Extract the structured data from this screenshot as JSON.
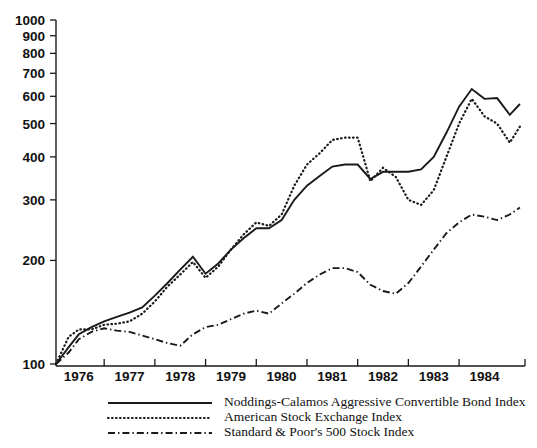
{
  "chart_data": {
    "type": "line",
    "title": "",
    "xlabel": "",
    "ylabel": "",
    "scale": "log",
    "ylim": [
      100,
      1000
    ],
    "xlim": [
      1975.5,
      1984.8
    ],
    "grid": false,
    "legend_position": "bottom-center",
    "ytick_labels": [
      "1000",
      "900",
      "800",
      "700",
      "600",
      "500",
      "400",
      "300",
      "200",
      "100"
    ],
    "ytick_values": [
      1000,
      900,
      800,
      700,
      600,
      500,
      400,
      300,
      200,
      100
    ],
    "xtick_labels": [
      "1976",
      "1977",
      "1978",
      "1979",
      "1980",
      "1981",
      "1982",
      "1983",
      "1984"
    ],
    "xtick_values": [
      1976,
      1977,
      1978,
      1979,
      1980,
      1981,
      1982,
      1983,
      1984
    ],
    "series": [
      {
        "name": "Noddings-Calamos Aggressive Convertible Bond Index",
        "style": "solid",
        "x": [
          1975.55,
          1975.8,
          1976.0,
          1976.25,
          1976.5,
          1976.75,
          1977.0,
          1977.25,
          1977.5,
          1977.75,
          1978.0,
          1978.25,
          1978.5,
          1978.75,
          1979.0,
          1979.25,
          1979.5,
          1979.75,
          1980.0,
          1980.25,
          1980.5,
          1980.75,
          1981.0,
          1981.25,
          1981.5,
          1981.75,
          1982.0,
          1982.25,
          1982.5,
          1982.75,
          1983.0,
          1983.25,
          1983.5,
          1983.75,
          1984.0,
          1984.25,
          1984.5,
          1984.7
        ],
        "values": [
          100,
          112,
          122,
          128,
          133,
          137,
          141,
          146,
          158,
          172,
          188,
          205,
          183,
          196,
          215,
          232,
          248,
          248,
          262,
          300,
          330,
          352,
          375,
          380,
          380,
          345,
          362,
          362,
          362,
          368,
          400,
          470,
          560,
          630,
          590,
          593,
          530,
          570
        ]
      },
      {
        "name": "American Stock Exchange Index",
        "style": "dotted",
        "x": [
          1975.55,
          1975.8,
          1976.0,
          1976.25,
          1976.5,
          1976.75,
          1977.0,
          1977.25,
          1977.5,
          1977.75,
          1978.0,
          1978.25,
          1978.5,
          1978.75,
          1979.0,
          1979.25,
          1979.5,
          1979.75,
          1980.0,
          1980.25,
          1980.5,
          1980.75,
          1981.0,
          1981.25,
          1981.5,
          1981.75,
          1982.0,
          1982.25,
          1982.5,
          1982.75,
          1983.0,
          1983.25,
          1983.5,
          1983.75,
          1984.0,
          1984.25,
          1984.5,
          1984.7
        ],
        "values": [
          100,
          120,
          126,
          126,
          130,
          131,
          133,
          140,
          152,
          168,
          182,
          198,
          178,
          192,
          215,
          238,
          258,
          252,
          272,
          330,
          380,
          410,
          448,
          455,
          455,
          340,
          372,
          350,
          300,
          290,
          320,
          400,
          500,
          590,
          525,
          500,
          440,
          490
        ]
      },
      {
        "name": "Standard & Poor's 500 Stock Index",
        "style": "dashdot",
        "x": [
          1975.55,
          1975.8,
          1976.0,
          1976.25,
          1976.5,
          1976.75,
          1977.0,
          1977.25,
          1977.5,
          1977.75,
          1978.0,
          1978.25,
          1978.5,
          1978.75,
          1979.0,
          1979.25,
          1979.5,
          1979.75,
          1980.0,
          1980.25,
          1980.5,
          1980.75,
          1981.0,
          1981.25,
          1981.5,
          1981.75,
          1982.0,
          1982.25,
          1982.5,
          1982.75,
          1983.0,
          1983.25,
          1983.5,
          1983.75,
          1984.0,
          1984.25,
          1984.5,
          1984.7
        ],
        "values": [
          100,
          108,
          118,
          124,
          127,
          125,
          124,
          121,
          118,
          115,
          113,
          122,
          128,
          130,
          135,
          140,
          143,
          140,
          150,
          160,
          172,
          182,
          190,
          190,
          185,
          170,
          163,
          160,
          172,
          192,
          215,
          240,
          258,
          272,
          268,
          262,
          272,
          285
        ]
      }
    ]
  },
  "legend": {
    "entries": [
      {
        "label": "Noddings-Calamos Aggressive Convertible Bond Index",
        "style": "solid"
      },
      {
        "label": "American Stock Exchange Index",
        "style": "dotted"
      },
      {
        "label": "Standard & Poor's 500 Stock Index",
        "style": "dashdot"
      }
    ]
  }
}
